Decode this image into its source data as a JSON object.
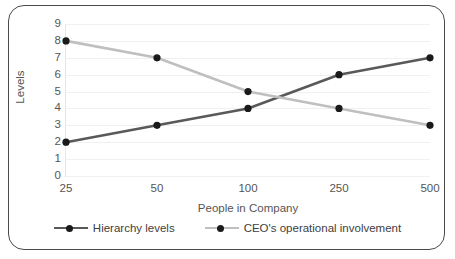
{
  "chart_data": {
    "type": "line",
    "title": "",
    "xlabel": "People in Company",
    "ylabel": "Levels",
    "categories": [
      "25",
      "50",
      "100",
      "250",
      "500"
    ],
    "ylim": [
      0,
      9
    ],
    "y_ticks": [
      "9",
      "8",
      "7",
      "6",
      "5",
      "4",
      "3",
      "2",
      "1",
      "0"
    ],
    "grid": true,
    "legend_position": "bottom",
    "series": [
      {
        "name": "Hierarchy levels",
        "values": [
          2,
          3,
          4,
          6,
          7
        ],
        "color": "#595959",
        "marker": "circle",
        "marker_color": "#1a1a1a"
      },
      {
        "name": "CEO's operational involvement",
        "values": [
          8,
          7,
          5,
          4,
          3
        ],
        "color": "#bfbfbf",
        "marker": "circle",
        "marker_color": "#1a1a1a"
      }
    ]
  },
  "figure": {
    "border_color": "#4a4a4a",
    "background": "#ffffff",
    "gridline_color": "#f0f0f0",
    "axis_text_color": "#555555"
  }
}
